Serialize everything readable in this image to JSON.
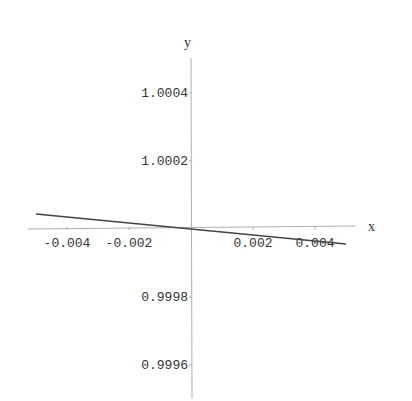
{
  "chart_data": {
    "type": "line",
    "title": "",
    "xlabel": "x",
    "ylabel": "y",
    "xlim": [
      -0.0053,
      0.0053
    ],
    "ylim": [
      0.99955,
      1.00051
    ],
    "grid": false,
    "legend": null,
    "x_ticks": [
      -0.004,
      -0.002,
      0.002,
      0.004
    ],
    "x_tick_labels": [
      "-0.004",
      "-0.002",
      "0.002",
      "0.004"
    ],
    "y_ticks": [
      1.0004,
      1.0002,
      0.9998,
      0.9996
    ],
    "y_tick_labels": [
      "1.0004",
      "1.0002",
      "0.9998",
      "0.9996"
    ],
    "series": [
      {
        "name": "f(x)",
        "x": [
          -0.005,
          0.0,
          0.005
        ],
        "y": [
          1.000044,
          1.0,
          0.999956
        ]
      }
    ]
  },
  "axes": {
    "x_label": "x",
    "y_label": "y"
  },
  "colors": {
    "axis": "#b0b0b0",
    "curve": "#444444",
    "text": "#333333"
  }
}
